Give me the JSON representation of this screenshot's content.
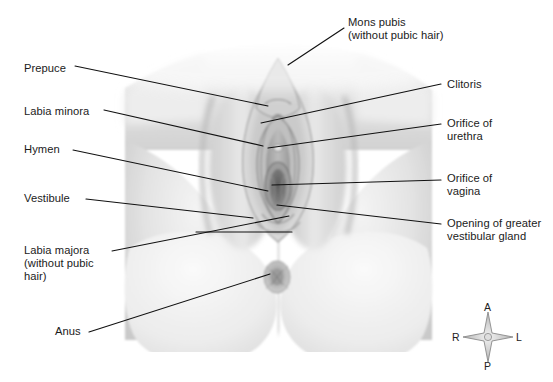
{
  "figure": {
    "border_color": "#a8a8a8",
    "text_color": "#1b1b1b",
    "leader_color": "#111111",
    "background": "#ffffff"
  },
  "labels": {
    "left": [
      {
        "id": "prepuce",
        "text": "Prepuce",
        "x": 24,
        "y": 69,
        "lines": 1
      },
      {
        "id": "labia-minora",
        "text": "Labia minora",
        "x": 24,
        "y": 112,
        "lines": 1
      },
      {
        "id": "hymen",
        "text": "Hymen",
        "x": 24,
        "y": 150,
        "lines": 1
      },
      {
        "id": "vestibule",
        "text": "Vestibule",
        "x": 24,
        "y": 199,
        "lines": 1
      },
      {
        "id": "labia-majora",
        "text": "Labia majora\n(without pubic\nhair)",
        "x": 24,
        "y": 250,
        "lines": 3
      },
      {
        "id": "anus",
        "text": "Anus",
        "x": 55,
        "y": 330,
        "lines": 1
      }
    ],
    "right": [
      {
        "id": "mons-pubis",
        "text": "Mons pubis\n(without pubic hair)",
        "x": 348,
        "y": 22,
        "lines": 2
      },
      {
        "id": "clitoris",
        "text": "Clitoris",
        "x": 447,
        "y": 84,
        "lines": 1
      },
      {
        "id": "orifice-urethra",
        "text": "Orifice of\nurethra",
        "x": 447,
        "y": 121,
        "lines": 2
      },
      {
        "id": "orifice-vagina",
        "text": "Orifice of\nvagina",
        "x": 447,
        "y": 176,
        "lines": 2
      },
      {
        "id": "greater-gland",
        "text": "Opening of greater\nvestibular gland",
        "x": 447,
        "y": 221,
        "lines": 2
      }
    ]
  },
  "compass": {
    "anterior": "A",
    "right": "R",
    "left": "L",
    "posterior": "P"
  },
  "leaders": [
    {
      "id": "leader-prepuce",
      "points": "75,66 268,106"
    },
    {
      "id": "leader-labia-minora",
      "points": "104,110 263,146"
    },
    {
      "id": "leader-hymen",
      "points": "73,150 268,191"
    },
    {
      "id": "leader-vestibule",
      "points": "86,199 253,218"
    },
    {
      "id": "leader-labia-majora",
      "points": "112,251 289,216"
    },
    {
      "id": "leader-anus",
      "points": "89,332 270,274"
    },
    {
      "id": "leader-mons-pubis",
      "points": "344,28 288,65"
    },
    {
      "id": "leader-clitoris",
      "points": "441,84 261,123"
    },
    {
      "id": "leader-orifice-urethra",
      "points": "441,124 268,148"
    },
    {
      "id": "leader-orifice-vagina",
      "points": "441,180 272,185"
    },
    {
      "id": "leader-greater-gland",
      "points": "441,224 277,205"
    }
  ]
}
